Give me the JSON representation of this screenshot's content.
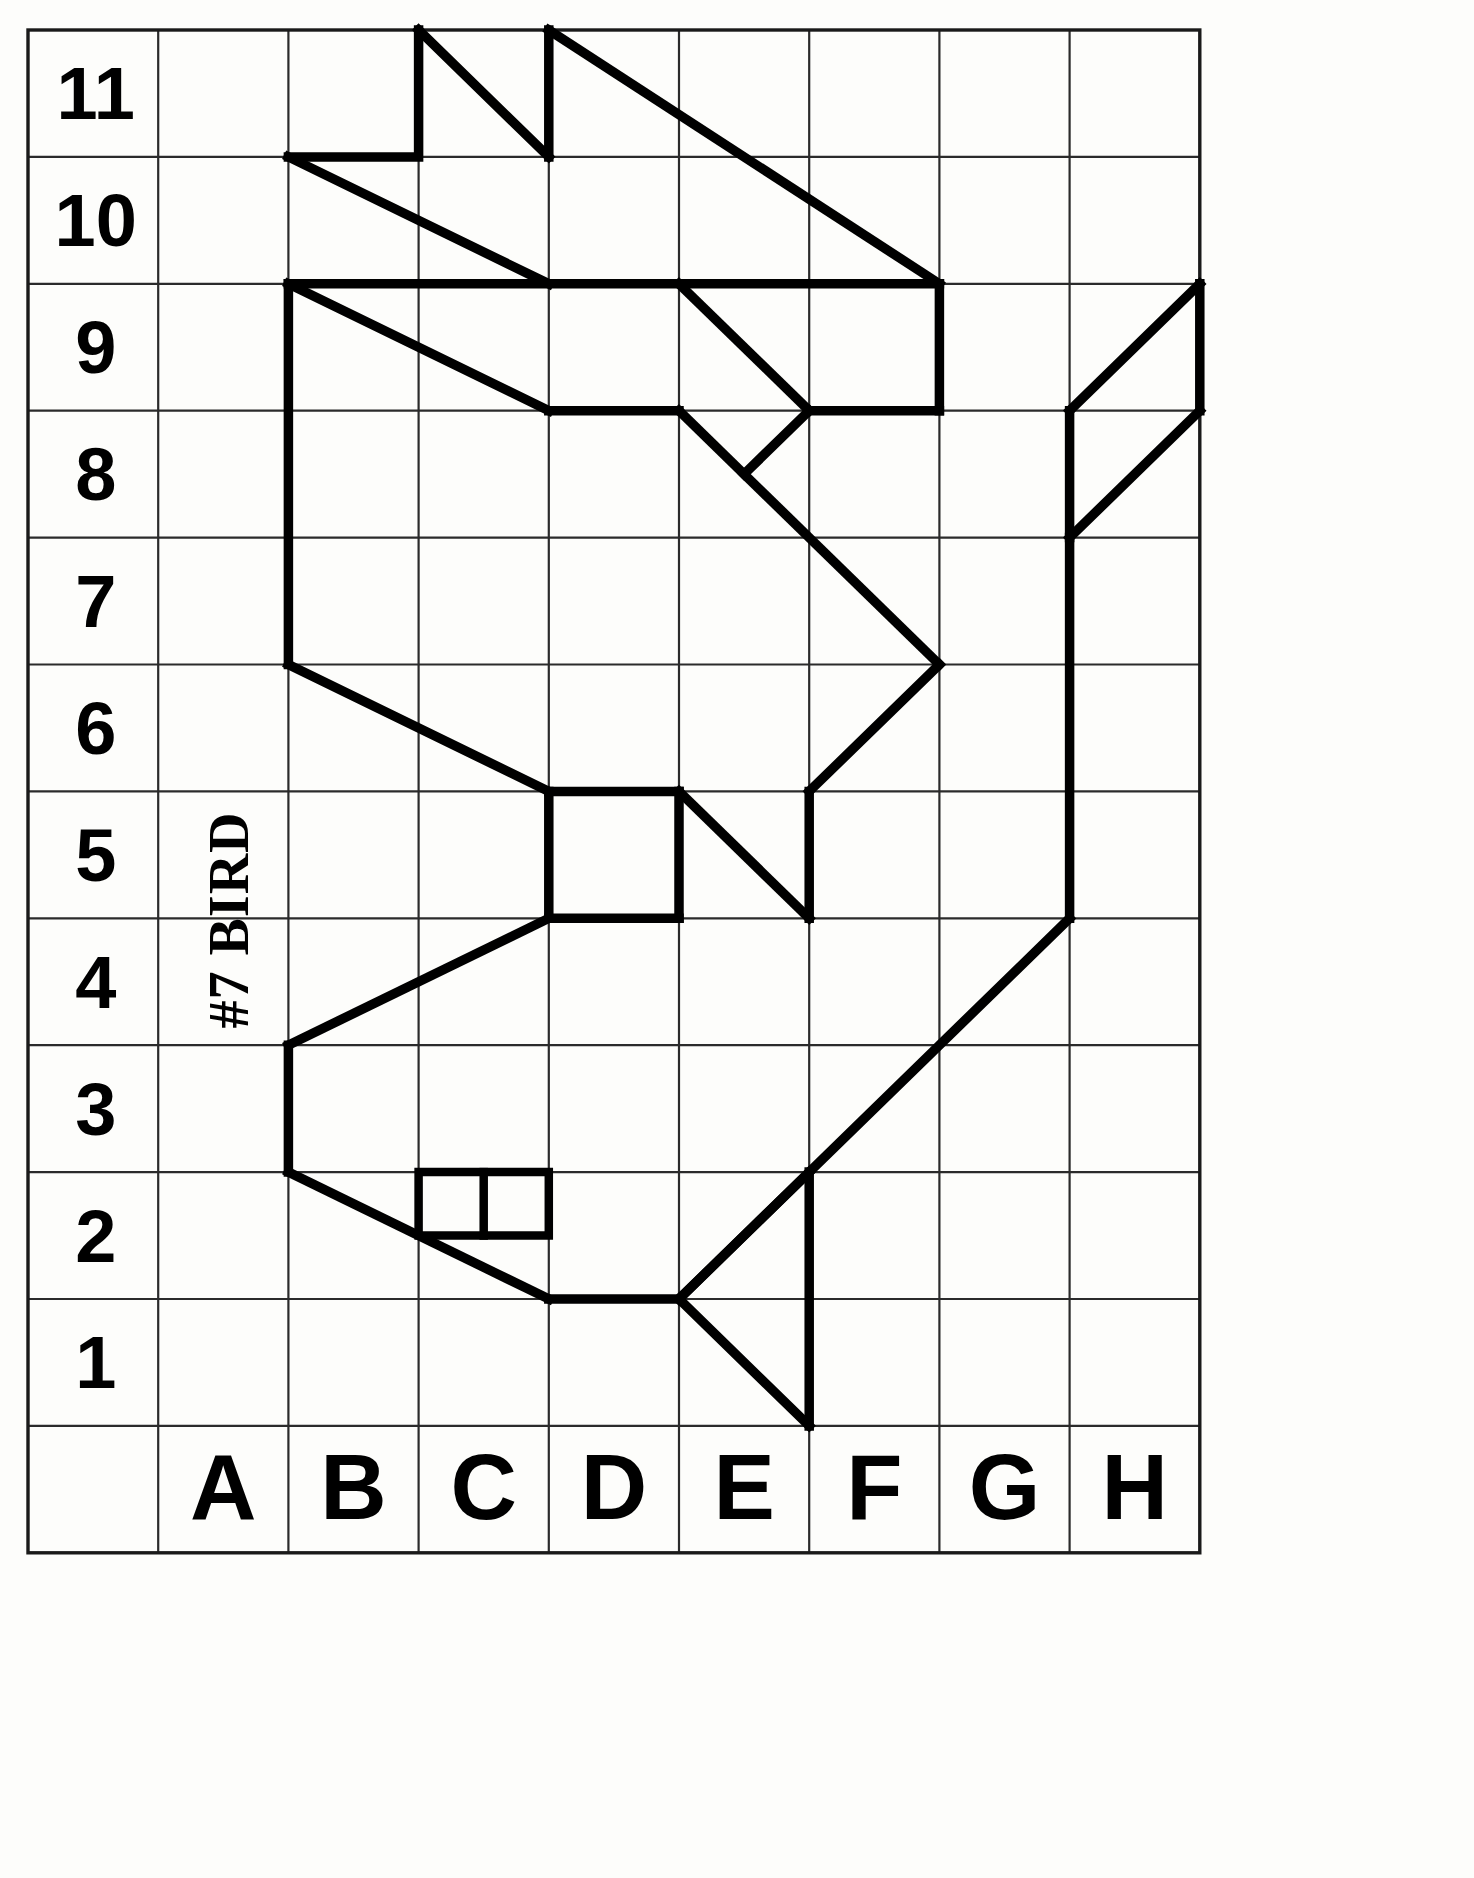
{
  "page": {
    "title_label": "#7 BIRD",
    "background_color": "#fdfdfb",
    "ink_color": "#000000",
    "grid_color": "#2b2b2b"
  },
  "grid": {
    "columns": [
      "A",
      "B",
      "C",
      "D",
      "E",
      "F",
      "G",
      "H"
    ],
    "rows": [
      "11",
      "10",
      "9",
      "8",
      "7",
      "6",
      "5",
      "4",
      "3",
      "2",
      "1"
    ],
    "row_count": 11,
    "column_count": 8,
    "geometry": {
      "x_origin": 28,
      "y_origin": 30,
      "cell_width": 130.2,
      "cell_height": 126.9,
      "label_column_width": 130.2,
      "label_row_height": 126.9
    }
  },
  "labels": {
    "rows": [
      {
        "text": "11",
        "col": 0,
        "row_index": 0
      },
      {
        "text": "10",
        "col": 0,
        "row_index": 1
      },
      {
        "text": "9",
        "col": 0,
        "row_index": 2
      },
      {
        "text": "8",
        "col": 0,
        "row_index": 3
      },
      {
        "text": "7",
        "col": 0,
        "row_index": 4
      },
      {
        "text": "6",
        "col": 0,
        "row_index": 5
      },
      {
        "text": "5",
        "col": 0,
        "row_index": 6
      },
      {
        "text": "4",
        "col": 0,
        "row_index": 7
      },
      {
        "text": "3",
        "col": 0,
        "row_index": 8
      },
      {
        "text": "2",
        "col": 0,
        "row_index": 9
      },
      {
        "text": "1",
        "col": 0,
        "row_index": 10
      }
    ],
    "columns": [
      {
        "text": "A",
        "col_index": 1
      },
      {
        "text": "B",
        "col_index": 2
      },
      {
        "text": "C",
        "col_index": 3
      },
      {
        "text": "D",
        "col_index": 4
      },
      {
        "text": "E",
        "col_index": 5
      },
      {
        "text": "F",
        "col_index": 6
      },
      {
        "text": "G",
        "col_index": 7
      },
      {
        "text": "H",
        "col_index": 8
      }
    ]
  },
  "chart_data": {
    "type": "line",
    "title": "#7 BIRD",
    "xlabel": "",
    "ylabel": "",
    "categories": [
      "A",
      "B",
      "C",
      "D",
      "E",
      "F",
      "G",
      "H"
    ],
    "grid": true,
    "note": "Grid-copy drawing puzzle: a bird figure drawn on an 8-column (A-H) by 11-row (1-11) lattice. Paths below are in lattice coordinates where x is measured in column units from the left edge of column A and y is the numbered row line.",
    "paths": [
      {
        "name": "wing-upper-left-spike",
        "points": [
          [
            2.0,
            11.5
          ],
          [
            2.0,
            10.5
          ],
          [
            1.0,
            10.5
          ]
        ]
      },
      {
        "name": "wing-upper-left-diagonal",
        "points": [
          [
            2.0,
            11.5
          ],
          [
            3.0,
            10.5
          ]
        ]
      },
      {
        "name": "wing-upper-right-spike",
        "points": [
          [
            3.0,
            11.5
          ],
          [
            3.0,
            10.5
          ]
        ]
      },
      {
        "name": "wing-long-diagonal",
        "points": [
          [
            3.0,
            11.5
          ],
          [
            6.0,
            9.5
          ]
        ]
      },
      {
        "name": "wing-lower-left-diagonal",
        "points": [
          [
            1.0,
            10.5
          ],
          [
            3.0,
            9.5
          ]
        ]
      },
      {
        "name": "back-top-edge",
        "points": [
          [
            1.0,
            9.5
          ],
          [
            4.0,
            9.5
          ],
          [
            6.0,
            9.5
          ]
        ]
      },
      {
        "name": "body-left-long-edge",
        "points": [
          [
            1.0,
            9.5
          ],
          [
            1.0,
            6.5
          ]
        ]
      },
      {
        "name": "back-diagonal-to-row8",
        "points": [
          [
            1.0,
            9.5
          ],
          [
            3.0,
            8.5
          ]
        ]
      },
      {
        "name": "row8-ledge-left",
        "points": [
          [
            3.0,
            8.5
          ],
          [
            4.0,
            8.5
          ]
        ]
      },
      {
        "name": "neck-diagonal-down",
        "points": [
          [
            4.0,
            9.5
          ],
          [
            5.0,
            8.5
          ]
        ]
      },
      {
        "name": "row8-ledge-right",
        "points": [
          [
            5.0,
            8.5
          ],
          [
            6.0,
            8.5
          ]
        ]
      },
      {
        "name": "wing-tip-vertical",
        "points": [
          [
            6.0,
            9.5
          ],
          [
            6.0,
            8.5
          ]
        ]
      },
      {
        "name": "chest-long-diagonal",
        "points": [
          [
            4.0,
            8.5
          ],
          [
            6.0,
            6.5
          ]
        ]
      },
      {
        "name": "chest-notch",
        "points": [
          [
            4.5,
            8.0
          ],
          [
            5.0,
            8.5
          ]
        ]
      },
      {
        "name": "breast-diagonal-down",
        "points": [
          [
            6.0,
            6.5
          ],
          [
            5.0,
            5.5
          ]
        ]
      },
      {
        "name": "breast-vertical",
        "points": [
          [
            5.0,
            5.5
          ],
          [
            5.0,
            4.5
          ]
        ]
      },
      {
        "name": "belly-upper-diagonal",
        "points": [
          [
            1.0,
            6.5
          ],
          [
            3.0,
            5.5
          ]
        ]
      },
      {
        "name": "belly-top-edge",
        "points": [
          [
            3.0,
            5.5
          ],
          [
            4.0,
            5.5
          ]
        ]
      },
      {
        "name": "tail-block-right-edge",
        "points": [
          [
            4.0,
            5.5
          ],
          [
            4.0,
            4.5
          ]
        ]
      },
      {
        "name": "tail-block-bottom-edge",
        "points": [
          [
            3.0,
            4.5
          ],
          [
            4.0,
            4.5
          ]
        ]
      },
      {
        "name": "tail-block-left-edge",
        "points": [
          [
            3.0,
            5.5
          ],
          [
            3.0,
            4.5
          ]
        ]
      },
      {
        "name": "tail-diagonal-to-row45",
        "points": [
          [
            4.0,
            5.5
          ],
          [
            5.0,
            4.5
          ]
        ]
      },
      {
        "name": "leg-upper-diagonal",
        "points": [
          [
            3.0,
            4.5
          ],
          [
            1.0,
            3.5
          ]
        ]
      },
      {
        "name": "leg-vertical",
        "points": [
          [
            1.0,
            3.5
          ],
          [
            1.0,
            2.5
          ]
        ]
      },
      {
        "name": "foot-diagonal",
        "points": [
          [
            1.0,
            2.5
          ],
          [
            3.0,
            1.5
          ]
        ]
      },
      {
        "name": "foot-bottom-edge",
        "points": [
          [
            3.0,
            1.5
          ],
          [
            4.0,
            1.5
          ]
        ]
      },
      {
        "name": "tail-fork-upper",
        "points": [
          [
            4.0,
            1.5
          ],
          [
            5.0,
            2.5
          ]
        ]
      },
      {
        "name": "tail-fork-lower",
        "points": [
          [
            4.0,
            1.5
          ],
          [
            5.0,
            0.5
          ]
        ]
      },
      {
        "name": "tail-fork-vertical",
        "points": [
          [
            5.0,
            2.5
          ],
          [
            5.0,
            0.5
          ]
        ]
      },
      {
        "name": "body-right-long-vertical",
        "points": [
          [
            7.0,
            7.5
          ],
          [
            7.0,
            4.5
          ]
        ]
      },
      {
        "name": "head-parallelogram-lower-left",
        "points": [
          [
            7.0,
            7.5
          ],
          [
            8.0,
            8.5
          ]
        ]
      },
      {
        "name": "head-parallelogram-upper-left",
        "points": [
          [
            7.0,
            8.5
          ],
          [
            8.0,
            9.5
          ]
        ]
      },
      {
        "name": "head-parallelogram-right-edge",
        "points": [
          [
            8.0,
            9.5
          ],
          [
            8.0,
            8.5
          ]
        ]
      },
      {
        "name": "head-left-vertical",
        "points": [
          [
            7.0,
            8.5
          ],
          [
            7.0,
            7.5
          ]
        ]
      },
      {
        "name": "beak-diagonal",
        "points": [
          [
            7.0,
            4.5
          ],
          [
            4.0,
            1.5
          ]
        ]
      },
      {
        "name": "eye-box-outline",
        "points": [
          [
            2.0,
            2.5
          ],
          [
            3.0,
            2.5
          ],
          [
            3.0,
            2.0
          ],
          [
            2.0,
            2.0
          ],
          [
            2.0,
            2.5
          ]
        ]
      },
      {
        "name": "eye-box-divider",
        "points": [
          [
            2.5,
            2.5
          ],
          [
            2.5,
            2.0
          ]
        ]
      }
    ]
  }
}
